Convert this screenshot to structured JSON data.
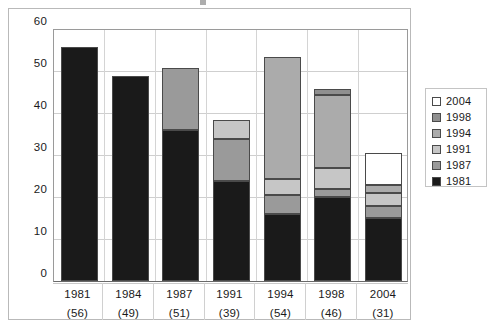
{
  "chart_data": {
    "type": "bar",
    "subtype": "stacked-bar",
    "title": "",
    "xlabel": "",
    "ylabel": "",
    "ylim": [
      0,
      60
    ],
    "ytick_step": 10,
    "yticks": [
      "60",
      "50",
      "40",
      "30",
      "20",
      "10",
      "0"
    ],
    "grid": true,
    "legend_position": "right",
    "categories": [
      "1981",
      "1984",
      "1987",
      "1991",
      "1994",
      "1998",
      "2004"
    ],
    "category_sublabels": [
      "(56)",
      "(49)",
      "(51)",
      "(39)",
      "(54)",
      "(46)",
      "(31)"
    ],
    "series": [
      {
        "name": "1981",
        "color": "#1a1a1a",
        "values": [
          56,
          49,
          36,
          24,
          16,
          20,
          15
        ]
      },
      {
        "name": "1987",
        "color": "#9a9a9a",
        "values": [
          0,
          0,
          15,
          10,
          4.5,
          2,
          3
        ]
      },
      {
        "name": "1991",
        "color": "#c6c6c6",
        "values": [
          0,
          0,
          0,
          4.5,
          4,
          5,
          3
        ]
      },
      {
        "name": "1994",
        "color": "#ababab",
        "values": [
          0,
          0,
          0,
          0,
          29,
          17.5,
          2
        ]
      },
      {
        "name": "1998",
        "color": "#8f8f8f",
        "values": [
          0,
          0,
          0,
          0,
          0,
          1.5,
          0
        ]
      },
      {
        "name": "2004",
        "color": "#ffffff",
        "values": [
          0,
          0,
          0,
          0,
          0,
          0,
          7.5
        ]
      }
    ],
    "totals": [
      56,
      49,
      51,
      38.5,
      53.5,
      46,
      30.5
    ],
    "legend_entries": [
      {
        "label": "2004",
        "color": "#ffffff"
      },
      {
        "label": "1998",
        "color": "#8f8f8f"
      },
      {
        "label": "1994",
        "color": "#ababab"
      },
      {
        "label": "1991",
        "color": "#c6c6c6"
      },
      {
        "label": "1987",
        "color": "#9a9a9a"
      },
      {
        "label": "1981",
        "color": "#1a1a1a"
      }
    ]
  },
  "axis": {
    "y": {
      "t0": "60",
      "t1": "50",
      "t2": "40",
      "t3": "30",
      "t4": "20",
      "t5": "10",
      "t6": "0"
    },
    "x": {
      "c0y": "1981",
      "c0n": "(56)",
      "c1y": "1984",
      "c1n": "(49)",
      "c2y": "1987",
      "c2n": "(51)",
      "c3y": "1991",
      "c3n": "(39)",
      "c4y": "1994",
      "c4n": "(54)",
      "c5y": "1998",
      "c5n": "(46)",
      "c6y": "2004",
      "c6n": "(31)"
    }
  },
  "legend": {
    "e0": "2004",
    "e1": "1998",
    "e2": "1994",
    "e3": "1991",
    "e4": "1987",
    "e5": "1981"
  }
}
